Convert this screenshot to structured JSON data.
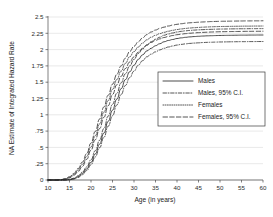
{
  "chart_data": {
    "type": "line",
    "title": "",
    "xlabel": "Age (in years)",
    "ylabel": "NA Estimate of Integrated Hazard Rate",
    "xlim": [
      10,
      60
    ],
    "ylim": [
      0,
      2.5
    ],
    "xticks": [
      10,
      15,
      20,
      25,
      30,
      35,
      40,
      45,
      50,
      55,
      60
    ],
    "xtick_labels": [
      "10",
      "15",
      "20",
      "25",
      "30",
      "35",
      "40",
      "45",
      "50",
      "55",
      "60"
    ],
    "yticks": [
      0,
      0.25,
      0.5,
      0.75,
      1,
      1.25,
      1.5,
      1.75,
      2,
      2.25,
      2.5
    ],
    "ytick_labels": [
      "0",
      ".25",
      ".5",
      ".75",
      "1",
      "1.25",
      "1.5",
      "1.75",
      "2",
      "2.25",
      "2.5"
    ],
    "grid": "horizontal",
    "legend_position": "center-right",
    "x": [
      10,
      11,
      12,
      13,
      14,
      15,
      16,
      17,
      18,
      19,
      20,
      21,
      22,
      23,
      24,
      25,
      26,
      27,
      28,
      29,
      30,
      31,
      32,
      33,
      34,
      35,
      36,
      37,
      38,
      39,
      40,
      41,
      42,
      43,
      44,
      45,
      46,
      47,
      48,
      49,
      50,
      51,
      52,
      53,
      54,
      55,
      56,
      57,
      58,
      59,
      60
    ],
    "series": [
      {
        "name": "Males",
        "style": "solid",
        "values": [
          0,
          0,
          0,
          0,
          0,
          0.005,
          0.02,
          0.05,
          0.1,
          0.17,
          0.27,
          0.4,
          0.55,
          0.72,
          0.9,
          1.07,
          1.24,
          1.4,
          1.54,
          1.66,
          1.76,
          1.85,
          1.92,
          1.98,
          2.02,
          2.06,
          2.09,
          2.12,
          2.14,
          2.155,
          2.17,
          2.18,
          2.188,
          2.195,
          2.2,
          2.204,
          2.208,
          2.211,
          2.213,
          2.215,
          2.217,
          2.218,
          2.219,
          2.22,
          2.221,
          2.222,
          2.222,
          2.223,
          2.223,
          2.224,
          2.224
        ]
      },
      {
        "name": "Males, 95% C.I. upper",
        "style": "dashdot",
        "values": [
          0,
          0,
          0,
          0,
          0,
          0.008,
          0.028,
          0.065,
          0.12,
          0.2,
          0.31,
          0.45,
          0.61,
          0.79,
          0.98,
          1.16,
          1.33,
          1.49,
          1.63,
          1.75,
          1.85,
          1.94,
          2.01,
          2.07,
          2.12,
          2.16,
          2.19,
          2.22,
          2.24,
          2.255,
          2.27,
          2.28,
          2.288,
          2.294,
          2.299,
          2.303,
          2.306,
          2.309,
          2.311,
          2.313,
          2.315,
          2.316,
          2.317,
          2.318,
          2.319,
          2.32,
          2.32,
          2.321,
          2.321,
          2.322,
          2.322
        ]
      },
      {
        "name": "Males, 95% C.I. lower",
        "style": "dashdot",
        "values": [
          0,
          0,
          0,
          0,
          0,
          0.003,
          0.014,
          0.038,
          0.082,
          0.145,
          0.235,
          0.355,
          0.495,
          0.655,
          0.825,
          0.985,
          1.15,
          1.31,
          1.45,
          1.57,
          1.67,
          1.76,
          1.83,
          1.89,
          1.93,
          1.965,
          1.995,
          2.02,
          2.04,
          2.055,
          2.07,
          2.08,
          2.088,
          2.095,
          2.1,
          2.104,
          2.108,
          2.111,
          2.113,
          2.115,
          2.117,
          2.118,
          2.119,
          2.12,
          2.121,
          2.122,
          2.122,
          2.123,
          2.123,
          2.124,
          2.124
        ]
      },
      {
        "name": "Females",
        "style": "dotted",
        "values": [
          0,
          0,
          0,
          0.004,
          0.015,
          0.04,
          0.085,
          0.15,
          0.24,
          0.36,
          0.51,
          0.68,
          0.86,
          1.04,
          1.22,
          1.39,
          1.54,
          1.67,
          1.79,
          1.89,
          1.97,
          2.04,
          2.1,
          2.15,
          2.19,
          2.22,
          2.245,
          2.265,
          2.282,
          2.296,
          2.308,
          2.317,
          2.325,
          2.331,
          2.336,
          2.34,
          2.344,
          2.347,
          2.35,
          2.352,
          2.354,
          2.355,
          2.356,
          2.357,
          2.358,
          2.359,
          2.36,
          2.36,
          2.361,
          2.361,
          2.362
        ]
      },
      {
        "name": "Females, 95% C.I. upper",
        "style": "longdash",
        "values": [
          0,
          0,
          0,
          0.006,
          0.02,
          0.05,
          0.1,
          0.175,
          0.275,
          0.405,
          0.565,
          0.745,
          0.935,
          1.12,
          1.3,
          1.47,
          1.62,
          1.75,
          1.87,
          1.97,
          2.05,
          2.12,
          2.18,
          2.23,
          2.27,
          2.3,
          2.325,
          2.345,
          2.362,
          2.376,
          2.388,
          2.397,
          2.405,
          2.411,
          2.416,
          2.42,
          2.424,
          2.427,
          2.43,
          2.432,
          2.434,
          2.435,
          2.436,
          2.437,
          2.438,
          2.439,
          2.44,
          2.44,
          2.441,
          2.441,
          2.442
        ]
      },
      {
        "name": "Females, 95% C.I. lower",
        "style": "longdash",
        "values": [
          0,
          0,
          0,
          0.002,
          0.011,
          0.031,
          0.07,
          0.128,
          0.208,
          0.318,
          0.458,
          0.618,
          0.788,
          0.962,
          1.14,
          1.31,
          1.46,
          1.59,
          1.71,
          1.81,
          1.89,
          1.96,
          2.02,
          2.07,
          2.11,
          2.14,
          2.165,
          2.185,
          2.202,
          2.216,
          2.228,
          2.237,
          2.245,
          2.251,
          2.256,
          2.26,
          2.264,
          2.267,
          2.27,
          2.272,
          2.274,
          2.275,
          2.276,
          2.277,
          2.278,
          2.279,
          2.28,
          2.28,
          2.281,
          2.281,
          2.282
        ]
      }
    ],
    "legend_entries": [
      {
        "label": "Males",
        "style": "solid"
      },
      {
        "label": "Males, 95% C.I.",
        "style": "dashdot"
      },
      {
        "label": "Females",
        "style": "dotted"
      },
      {
        "label": "Females, 95% C.I.",
        "style": "longdash"
      }
    ],
    "colors": {
      "curve": "#2a2a2a",
      "grid": "#d2d2d2",
      "axis": "#4a4a4a",
      "background": "#ffffff"
    }
  }
}
